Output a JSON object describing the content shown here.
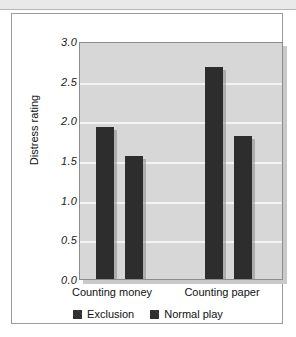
{
  "chart_data": {
    "type": "bar",
    "title": "",
    "xlabel": "",
    "ylabel": "Distress rating",
    "categories": [
      "Counting money",
      "Counting paper"
    ],
    "series": [
      {
        "name": "Exclusion",
        "values": [
          1.93,
          2.7
        ]
      },
      {
        "name": "Normal play",
        "values": [
          1.56,
          1.82
        ]
      }
    ],
    "ylim": [
      0.0,
      3.0
    ],
    "yticks": [
      "0.0",
      "0.5",
      "1.0",
      "1.5",
      "2.0",
      "2.5",
      "3.0"
    ],
    "ytick_values": [
      0.0,
      0.5,
      1.0,
      1.5,
      2.0,
      2.5,
      3.0
    ],
    "grid": true,
    "legend_position": "bottom",
    "bar_color": "#2d2d2d",
    "plot_background": "#d7d7d7",
    "gridline_color": "#f4f4f4"
  }
}
